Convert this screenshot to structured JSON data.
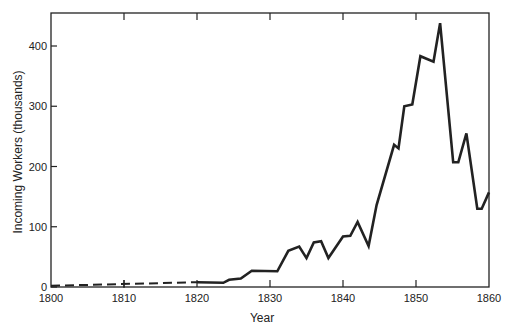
{
  "chart_data": {
    "type": "line",
    "title": "",
    "xlabel": "Year",
    "ylabel": "Incoming Workers (thousands)",
    "xlim": [
      1800,
      1860
    ],
    "ylim": [
      0,
      450
    ],
    "grid": false,
    "legend": null,
    "x_ticks": [
      1800,
      1810,
      1820,
      1830,
      1840,
      1850,
      1860
    ],
    "y_ticks": [
      0,
      100,
      200,
      300,
      400
    ],
    "series": [
      {
        "name": "estimated (dashed)",
        "style": "dashed",
        "x": [
          1800,
          1820
        ],
        "values": [
          2,
          8
        ]
      },
      {
        "name": "Incoming Workers",
        "style": "solid",
        "x": [
          1820,
          1823.6,
          1824.4,
          1826,
          1827.5,
          1831,
          1832.5,
          1834,
          1835,
          1836,
          1837,
          1838,
          1840,
          1841,
          1842,
          1843.5,
          1844.6,
          1847,
          1847.6,
          1848.4,
          1849.5,
          1850.6,
          1852.4,
          1853.3,
          1855.1,
          1855.8,
          1856.9,
          1858.4,
          1859,
          1860
        ],
        "values": [
          8,
          7,
          12,
          14,
          27,
          26,
          60,
          67,
          48,
          74,
          76,
          48,
          84,
          85,
          108,
          68,
          136,
          236,
          230,
          300,
          303,
          383,
          374,
          438,
          207,
          207,
          255,
          130,
          130,
          157
        ]
      }
    ]
  }
}
